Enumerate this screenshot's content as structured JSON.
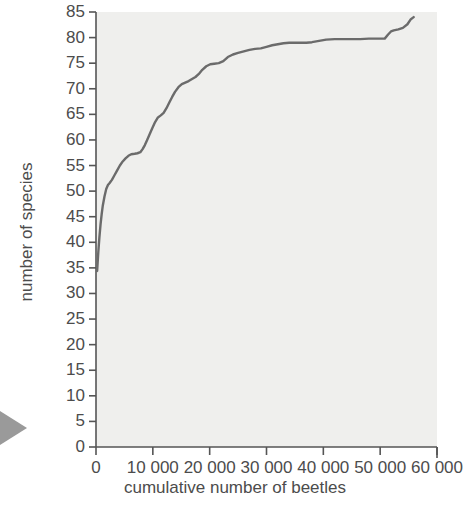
{
  "figure": {
    "background_color": "#ffffff",
    "plot_background_color": "#efefed",
    "line_color": "#6b6b6b",
    "axis_color": "#555555",
    "text_color": "#4c4c4c",
    "edge_marker": "left-page-arrow"
  },
  "chart_data": {
    "type": "line",
    "title": "",
    "subtitle": "",
    "xlabel": "cumulative number of beetles",
    "ylabel": "number of species",
    "xlim": [
      0,
      60000
    ],
    "ylim": [
      0,
      85
    ],
    "grid": false,
    "legend": null,
    "xticks": [
      0,
      10000,
      20000,
      30000,
      40000,
      50000,
      60000
    ],
    "xtick_labels": [
      "0",
      "10 000",
      "20 000",
      "30 000",
      "40 000",
      "50 000",
      "60 000"
    ],
    "yticks": [
      0,
      5,
      10,
      15,
      20,
      25,
      30,
      35,
      40,
      45,
      50,
      55,
      60,
      65,
      70,
      75,
      80,
      85
    ],
    "ytick_labels": [
      "0",
      "5",
      "10",
      "15",
      "20",
      "25",
      "30",
      "35",
      "40",
      "45",
      "50",
      "55",
      "60",
      "65",
      "70",
      "75",
      "80",
      "85"
    ],
    "series": [
      {
        "name": "species accumulation",
        "x": [
          200,
          400,
          600,
          800,
          1000,
          1200,
          1500,
          1800,
          2100,
          2400,
          2800,
          3200,
          3700,
          4200,
          4700,
          5200,
          5700,
          6200,
          6800,
          7300,
          7800,
          8200,
          8600,
          9000,
          9400,
          9900,
          10400,
          10900,
          11400,
          11900,
          12400,
          12900,
          13400,
          13900,
          14500,
          15100,
          15700,
          16300,
          16900,
          17500,
          18100,
          18700,
          19400,
          20100,
          20800,
          21600,
          22400,
          23200,
          24100,
          25000,
          26000,
          27000,
          28000,
          29000,
          30000,
          31000,
          32000,
          33000,
          34000,
          35000,
          36000,
          37000,
          38000,
          39000,
          40500,
          42000,
          43500,
          45000,
          46500,
          48000,
          49500,
          50800,
          51400,
          51900,
          52400,
          53200,
          54000,
          54800,
          55400,
          55900
        ],
        "y": [
          34.4,
          38,
          41,
          43.5,
          45.5,
          47.2,
          49,
          50.4,
          51.2,
          51.6,
          52.2,
          53.0,
          54.0,
          55.0,
          55.8,
          56.4,
          56.9,
          57.2,
          57.3,
          57.4,
          57.6,
          58.2,
          59.0,
          60.0,
          61.0,
          62.3,
          63.5,
          64.4,
          64.8,
          65.3,
          66.2,
          67.3,
          68.4,
          69.4,
          70.3,
          70.9,
          71.2,
          71.5,
          71.9,
          72.3,
          72.9,
          73.7,
          74.4,
          74.8,
          74.9,
          75.0,
          75.4,
          76.2,
          76.7,
          77.0,
          77.3,
          77.6,
          77.8,
          77.9,
          78.2,
          78.5,
          78.7,
          78.9,
          79.0,
          79.0,
          79.0,
          79.0,
          79.1,
          79.3,
          79.6,
          79.7,
          79.7,
          79.7,
          79.7,
          79.8,
          79.8,
          79.8,
          80.6,
          81.2,
          81.4,
          81.6,
          81.9,
          82.6,
          83.6,
          84.0
        ]
      }
    ],
    "annotations": []
  },
  "axes": {
    "x_title": "cumulative number of beetles",
    "y_title": "number of species"
  }
}
